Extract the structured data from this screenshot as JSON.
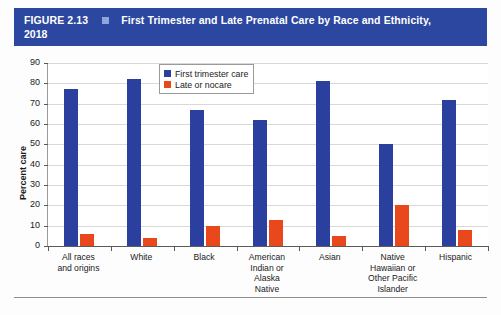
{
  "header": {
    "figure_number": "FIGURE 2.13",
    "bullet_icon": "square-bullet-icon",
    "title_line1": "First Trimester and Late Prenatal Care by Race and Ethnicity,",
    "title_line2": "2018",
    "band_color": "#2c47a0",
    "bullet_color": "#8fa6dd",
    "text_color": "#ffffff"
  },
  "legend": {
    "position": "inside-top-center",
    "entries": [
      {
        "label": "First trimester care",
        "color": "#2b3f9e"
      },
      {
        "label": "Late or nocare",
        "color": "#e8481c"
      }
    ]
  },
  "axes": {
    "ylabel": "Percent care",
    "yticks": [
      "90",
      "80",
      "70",
      "60",
      "50",
      "40",
      "30",
      "20",
      "10",
      "0"
    ],
    "ymin": 0,
    "ymax": 90,
    "ystep": 10
  },
  "chart_data": {
    "type": "bar",
    "title": "First Trimester and Late Prenatal Care by Race and Ethnicity, 2018",
    "xlabel": "",
    "ylabel": "Percent care",
    "ylim": [
      0,
      90
    ],
    "ystep": 10,
    "grid": true,
    "legend_position": "inside-top-center",
    "categories": [
      "All races and origins",
      "White",
      "Black",
      "American Indian or Alaska Native",
      "Asian",
      "Native Hawaiian or Other Pacific Islander",
      "Hispanic"
    ],
    "category_lines": [
      [
        "All races",
        "and origins"
      ],
      [
        "White"
      ],
      [
        "Black"
      ],
      [
        "American",
        "Indian or",
        "Alaska",
        "Native"
      ],
      [
        "Asian"
      ],
      [
        "Native",
        "Hawaiian or",
        "Other Pacific",
        "Islander"
      ],
      [
        "Hispanic"
      ]
    ],
    "series": [
      {
        "name": "First trimester care",
        "color": "#2b3f9e",
        "values": [
          77,
          82,
          67,
          62,
          81,
          50,
          72
        ]
      },
      {
        "name": "Late or nocare",
        "color": "#e8481c",
        "values": [
          6,
          4,
          10,
          13,
          5,
          20,
          8
        ]
      }
    ]
  }
}
